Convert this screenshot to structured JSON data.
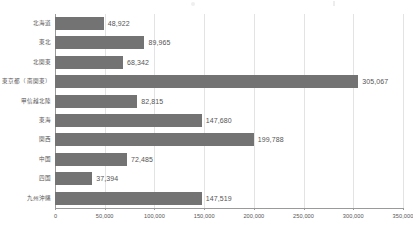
{
  "chart_data": {
    "type": "bar",
    "orientation": "horizontal",
    "title": "",
    "subtitle": "",
    "xlabel": "",
    "ylabel": "",
    "categories": [
      "北海道",
      "東北",
      "北関東",
      "東京都（南関東）",
      "甲信越北陸",
      "東海",
      "関西",
      "中国",
      "四国",
      "九州沖縄"
    ],
    "values": [
      48922,
      89965,
      68342,
      305067,
      82815,
      147680,
      199788,
      72485,
      37394,
      147519
    ],
    "value_labels": [
      "48,922",
      "89,965",
      "68,342",
      "305,067",
      "82,815",
      "147,680",
      "199,788",
      "72,485",
      "37,394",
      "147,519"
    ],
    "xlim": [
      0,
      350000
    ],
    "xticks": [
      0,
      50000,
      100000,
      150000,
      200000,
      250000,
      300000,
      350000
    ],
    "xtick_labels": [
      "0",
      "50,000",
      "100,000",
      "150,000",
      "200,000",
      "250,000",
      "300,000",
      "350,000"
    ],
    "grid": "vertical",
    "legend": "none",
    "bar_color": "#737373",
    "gridline_color": "#e3e3e3",
    "axis_color": "#9a9a9a",
    "background_color": "#ffffff",
    "label_color": "#555555"
  }
}
